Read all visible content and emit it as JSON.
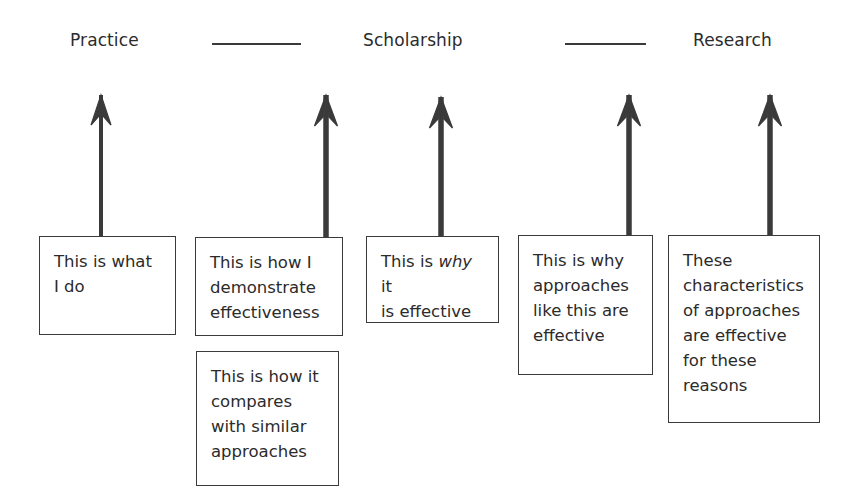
{
  "header": {
    "labels": [
      {
        "text": "Practice",
        "x": 70,
        "y": 30
      },
      {
        "text": "Scholarship",
        "x": 363,
        "y": 30
      },
      {
        "text": "Research",
        "x": 693,
        "y": 30
      }
    ],
    "rules": [
      {
        "x": 212,
        "y": 43,
        "width": 89
      },
      {
        "x": 565,
        "y": 43,
        "width": 81
      }
    ]
  },
  "arrows": [
    {
      "name": "arrow-practice",
      "x": 101,
      "tip_y": 95,
      "base_y": 238,
      "shaft_width": 4,
      "head_width": 20,
      "head_height": 30
    },
    {
      "name": "arrow-demonstrate",
      "x": 326,
      "tip_y": 95,
      "base_y": 238,
      "shaft_width": 5.5,
      "head_width": 23,
      "head_height": 31
    },
    {
      "name": "arrow-why-effective",
      "x": 441,
      "tip_y": 97,
      "base_y": 238,
      "shaft_width": 5.5,
      "head_width": 23,
      "head_height": 31
    },
    {
      "name": "arrow-why-approaches",
      "x": 629,
      "tip_y": 95,
      "base_y": 238,
      "shaft_width": 5.5,
      "head_width": 23,
      "head_height": 31
    },
    {
      "name": "arrow-characteristics",
      "x": 770,
      "tip_y": 95,
      "base_y": 238,
      "shaft_width": 5.5,
      "head_width": 23,
      "head_height": 31
    }
  ],
  "boxes": [
    {
      "name": "box-practice",
      "text": "This is what\nI do",
      "italic_word": null,
      "x": 39,
      "y": 236,
      "width": 137,
      "height": 99
    },
    {
      "name": "box-demonstrate-effectiveness",
      "text": "This is how I\ndemonstrate\neffectiveness",
      "italic_word": null,
      "x": 195,
      "y": 237,
      "width": 148,
      "height": 99
    },
    {
      "name": "box-compares-similar-approaches",
      "text": "This is how it\ncompares\nwith similar\napproaches",
      "italic_word": null,
      "x": 196,
      "y": 351,
      "width": 143,
      "height": 135
    },
    {
      "name": "box-why-it-is-effective",
      "text": "This is why it\nis effective",
      "italic_word": "why",
      "x": 366,
      "y": 236,
      "width": 133,
      "height": 87
    },
    {
      "name": "box-why-approaches-effective",
      "text": "This is why\napproaches\nlike this are\neffective",
      "italic_word": null,
      "x": 518,
      "y": 235,
      "width": 135,
      "height": 140
    },
    {
      "name": "box-characteristics-reasons",
      "text": "These\ncharacteristics\nof approaches\nare effective\nfor these\nreasons",
      "italic_word": null,
      "x": 668,
      "y": 235,
      "width": 152,
      "height": 188
    }
  ],
  "style": {
    "stroke_color": "#3a3a3a",
    "text_color": "#2b2b2b",
    "background": "#ffffff"
  }
}
